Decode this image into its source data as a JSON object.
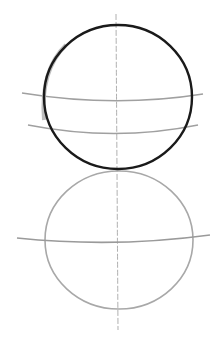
{
  "drawing": {
    "subject": "head construction sketch",
    "colors": {
      "background": "#ffffff",
      "ink_dark": "#1a1a1a",
      "pencil_light": "#a8a8a8",
      "pencil_mid": "#9a9a9a"
    },
    "top_circle": {
      "cx": 118,
      "cy": 97,
      "rx": 74,
      "ry": 72
    },
    "bottom_circle": {
      "cx": 119,
      "cy": 240,
      "rx": 74,
      "ry": 69
    },
    "center_line": {
      "x": 117,
      "y1": 14,
      "y2": 330
    },
    "guide_lines": [
      {
        "name": "upper-horizontal-1",
        "x1": 22,
        "y1": 94,
        "x2": 203,
        "y2": 94,
        "sag": 8
      },
      {
        "name": "upper-horizontal-2",
        "x1": 28,
        "y1": 125,
        "x2": 198,
        "y2": 125,
        "sag": 9
      },
      {
        "name": "lower-horizontal",
        "x1": 17,
        "y1": 238,
        "x2": 210,
        "y2": 235,
        "sag": 6
      }
    ]
  }
}
